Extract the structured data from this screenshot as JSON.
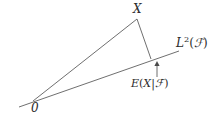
{
  "diagram": {
    "background_color": "#ffffff",
    "line_color": "#4a4a4a",
    "text_color": "#2b2b2b",
    "labels": {
      "vector_x": "X",
      "subspace": {
        "base": "L",
        "exponent": "2",
        "open_paren": "(",
        "sigma_field": "ℱ",
        "close_paren": ")",
        "full": "L2(ℱ)"
      },
      "projection": {
        "e": "E",
        "open_paren": "(",
        "x": "X",
        "bar": "|",
        "sigma_field": "ℱ",
        "close_paren": ")",
        "full": "E(X|ℱ)"
      },
      "origin": "0",
      "arrow": "↑"
    },
    "geometry": {
      "origin_point": [
        33,
        101
      ],
      "x_point": [
        137,
        19
      ],
      "projection_point": [
        151,
        59
      ],
      "subspace_line_start": [
        19,
        107
      ],
      "subspace_line_end": [
        179,
        51
      ],
      "arrow_x": 157,
      "arrow_top_y": 63,
      "arrow_bottom_y": 77
    }
  }
}
